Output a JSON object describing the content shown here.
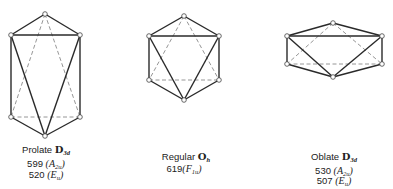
{
  "figures": [
    {
      "name": "prolate",
      "label": "Prolate",
      "group": "D",
      "group_sub": "3d",
      "frequencies": [
        {
          "value": "599",
          "symmetry": "A",
          "sym_sub": "2u"
        },
        {
          "value": "520",
          "symmetry": "E",
          "sym_sub": "u"
        }
      ],
      "vertices": {
        "top": [
          45,
          14
        ],
        "ul": [
          11,
          35
        ],
        "ur": [
          80,
          35
        ],
        "ll": [
          11,
          117
        ],
        "lr": [
          80,
          117
        ],
        "bottom": [
          45,
          136
        ]
      }
    },
    {
      "name": "regular",
      "label": "Regular",
      "group": "O",
      "group_sub": "h",
      "frequencies": [
        {
          "value": "619",
          "symmetry": "F",
          "sym_sub": "1u"
        }
      ],
      "vertices": {
        "top": [
          184,
          16
        ],
        "ul": [
          149,
          36
        ],
        "ur": [
          219,
          36
        ],
        "ll": [
          149,
          80
        ],
        "lr": [
          219,
          80
        ],
        "bottom": [
          184,
          100
        ]
      }
    },
    {
      "name": "oblate",
      "label": "Oblate",
      "group": "D",
      "group_sub": "3d",
      "frequencies": [
        {
          "value": "530",
          "symmetry": "A",
          "sym_sub": "2u"
        },
        {
          "value": "507",
          "symmetry": "E",
          "sym_sub": "u"
        }
      ],
      "vertices": {
        "top": [
          333,
          23
        ],
        "ul": [
          287,
          36
        ],
        "ur": [
          382,
          36
        ],
        "ll": [
          287,
          64
        ],
        "lr": [
          382,
          64
        ],
        "bottom": [
          333,
          77
        ]
      }
    }
  ],
  "colors": {
    "solid_edge": "#2a2a2a",
    "dashed_edge": "#8a8a8a",
    "vertex_fill": "#ffffff"
  }
}
